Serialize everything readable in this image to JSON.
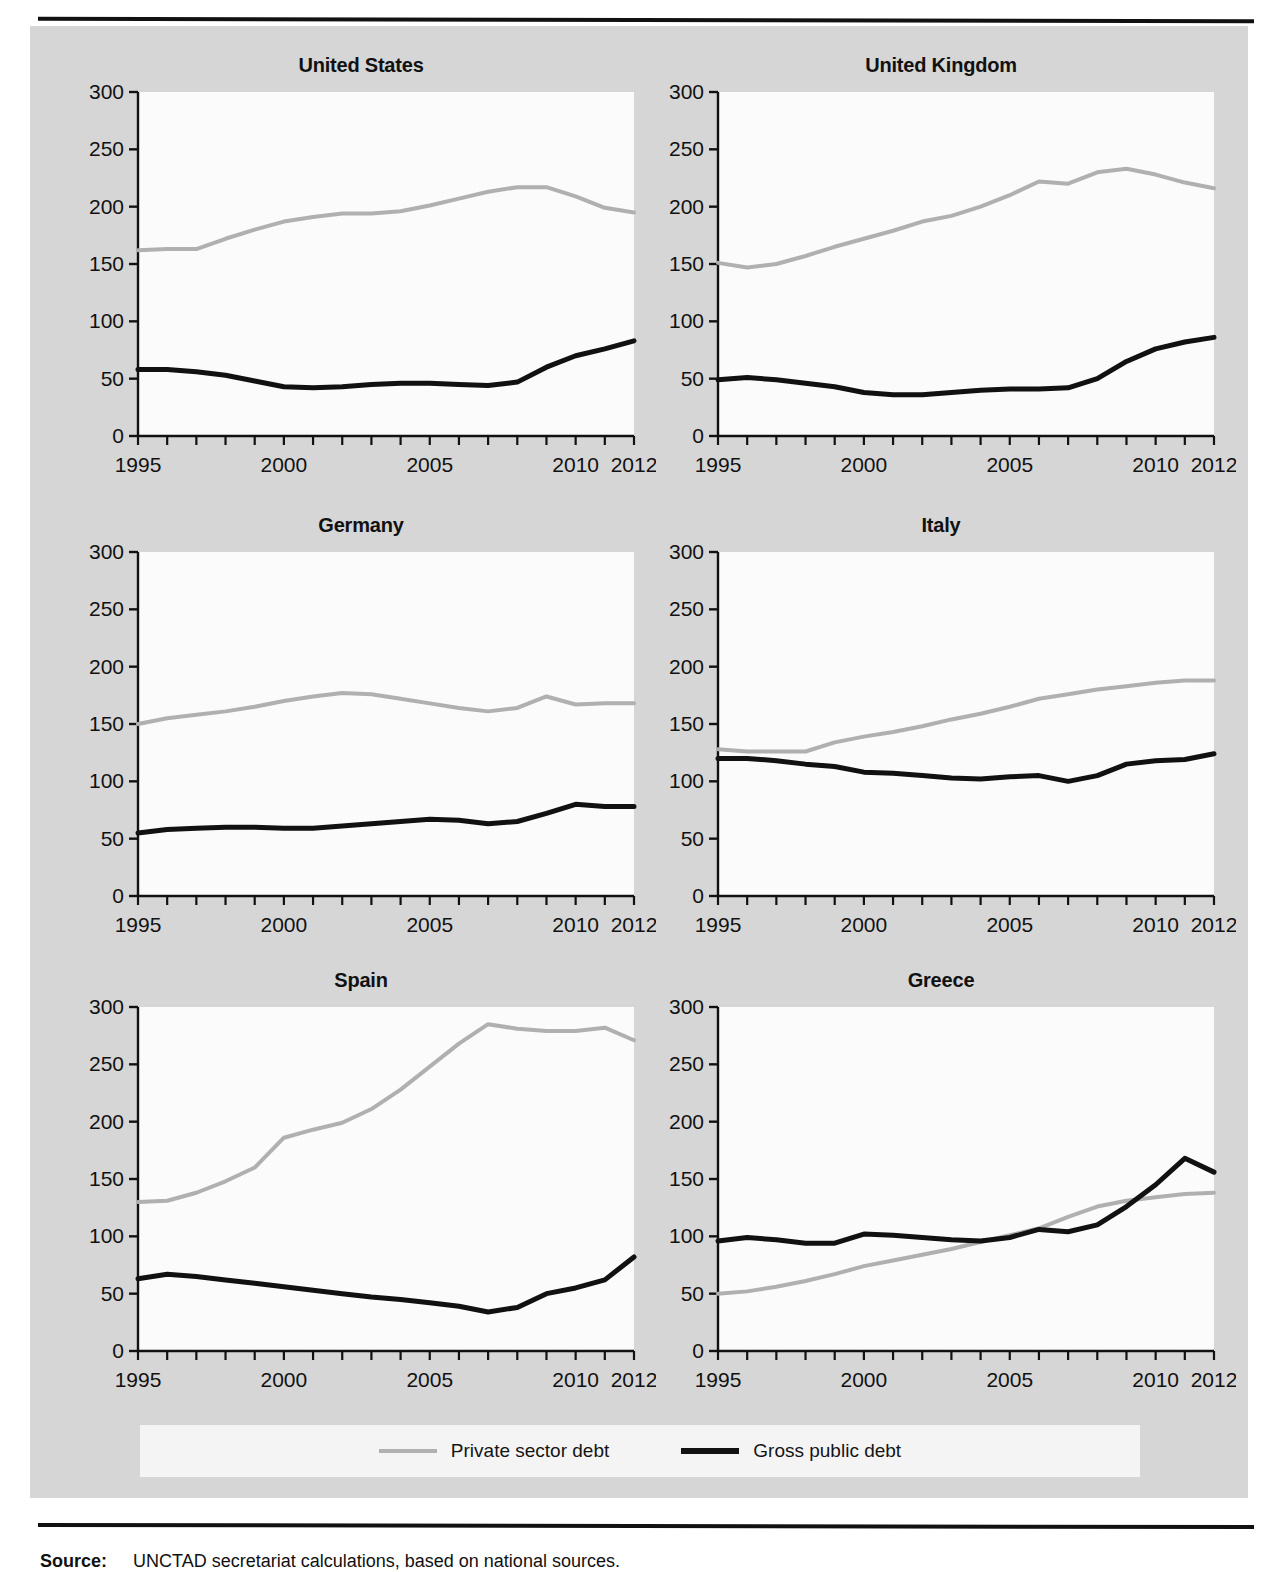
{
  "figure": {
    "source_label": "Source:",
    "source_text": "UNCTAD secretariat calculations, based on national sources."
  },
  "legend": {
    "items": [
      {
        "label": "Private sector debt",
        "color": "#b0b0b0",
        "swatch": "private"
      },
      {
        "label": "Gross public debt",
        "color": "#111111",
        "swatch": "public"
      }
    ]
  },
  "chart_data": [
    {
      "type": "line",
      "title": "United States",
      "xlabel": "",
      "ylabel": "",
      "xlim": [
        1995,
        2012
      ],
      "ylim": [
        0,
        300
      ],
      "yticks": [
        0,
        50,
        100,
        150,
        200,
        250,
        300
      ],
      "xticks": [
        1995,
        2000,
        2005,
        2010,
        2012
      ],
      "x": [
        1995,
        1996,
        1997,
        1998,
        1999,
        2000,
        2001,
        2002,
        2003,
        2004,
        2005,
        2006,
        2007,
        2008,
        2009,
        2010,
        2011,
        2012
      ],
      "grid": false,
      "legend_position": "bottom-shared",
      "series": [
        {
          "name": "Private sector debt",
          "color": "#b0b0b0",
          "values": [
            162,
            163,
            163,
            172,
            180,
            187,
            191,
            194,
            194,
            196,
            201,
            207,
            213,
            217,
            217,
            209,
            199,
            195
          ]
        },
        {
          "name": "Gross public debt",
          "color": "#111111",
          "values": [
            58,
            58,
            56,
            53,
            48,
            43,
            42,
            43,
            45,
            46,
            46,
            45,
            44,
            47,
            60,
            70,
            76,
            83
          ]
        }
      ]
    },
    {
      "type": "line",
      "title": "United Kingdom",
      "xlabel": "",
      "ylabel": "",
      "xlim": [
        1995,
        2012
      ],
      "ylim": [
        0,
        300
      ],
      "yticks": [
        0,
        50,
        100,
        150,
        200,
        250,
        300
      ],
      "xticks": [
        1995,
        2000,
        2005,
        2010,
        2012
      ],
      "x": [
        1995,
        1996,
        1997,
        1998,
        1999,
        2000,
        2001,
        2002,
        2003,
        2004,
        2005,
        2006,
        2007,
        2008,
        2009,
        2010,
        2011,
        2012
      ],
      "grid": false,
      "legend_position": "bottom-shared",
      "series": [
        {
          "name": "Private sector debt",
          "color": "#b0b0b0",
          "values": [
            151,
            147,
            150,
            157,
            165,
            172,
            179,
            187,
            192,
            200,
            210,
            222,
            220,
            230,
            233,
            228,
            221,
            216
          ]
        },
        {
          "name": "Gross public debt",
          "color": "#111111",
          "values": [
            49,
            51,
            49,
            46,
            43,
            38,
            36,
            36,
            38,
            40,
            41,
            41,
            42,
            50,
            65,
            76,
            82,
            86
          ]
        }
      ]
    },
    {
      "type": "line",
      "title": "Germany",
      "xlabel": "",
      "ylabel": "",
      "xlim": [
        1995,
        2012
      ],
      "ylim": [
        0,
        300
      ],
      "yticks": [
        0,
        50,
        100,
        150,
        200,
        250,
        300
      ],
      "xticks": [
        1995,
        2000,
        2005,
        2010,
        2012
      ],
      "x": [
        1995,
        1996,
        1997,
        1998,
        1999,
        2000,
        2001,
        2002,
        2003,
        2004,
        2005,
        2006,
        2007,
        2008,
        2009,
        2010,
        2011,
        2012
      ],
      "grid": false,
      "legend_position": "bottom-shared",
      "series": [
        {
          "name": "Private sector debt",
          "color": "#b0b0b0",
          "values": [
            150,
            155,
            158,
            161,
            165,
            170,
            174,
            177,
            176,
            172,
            168,
            164,
            161,
            164,
            174,
            167,
            168,
            168
          ]
        },
        {
          "name": "Gross public debt",
          "color": "#111111",
          "values": [
            55,
            58,
            59,
            60,
            60,
            59,
            59,
            61,
            63,
            65,
            67,
            66,
            63,
            65,
            72,
            80,
            78,
            78
          ]
        }
      ]
    },
    {
      "type": "line",
      "title": "Italy",
      "xlabel": "",
      "ylabel": "",
      "xlim": [
        1995,
        2012
      ],
      "ylim": [
        0,
        300
      ],
      "yticks": [
        0,
        50,
        100,
        150,
        200,
        250,
        300
      ],
      "xticks": [
        1995,
        2000,
        2005,
        2010,
        2012
      ],
      "x": [
        1995,
        1996,
        1997,
        1998,
        1999,
        2000,
        2001,
        2002,
        2003,
        2004,
        2005,
        2006,
        2007,
        2008,
        2009,
        2010,
        2011,
        2012
      ],
      "grid": false,
      "legend_position": "bottom-shared",
      "series": [
        {
          "name": "Private sector debt",
          "color": "#b0b0b0",
          "values": [
            128,
            126,
            126,
            126,
            134,
            139,
            143,
            148,
            154,
            159,
            165,
            172,
            176,
            180,
            183,
            186,
            188,
            188
          ]
        },
        {
          "name": "Gross public debt",
          "color": "#111111",
          "values": [
            120,
            120,
            118,
            115,
            113,
            108,
            107,
            105,
            103,
            102,
            104,
            105,
            100,
            105,
            115,
            118,
            119,
            124
          ]
        }
      ]
    },
    {
      "type": "line",
      "title": "Spain",
      "xlabel": "",
      "ylabel": "",
      "xlim": [
        1995,
        2012
      ],
      "ylim": [
        0,
        300
      ],
      "yticks": [
        0,
        50,
        100,
        150,
        200,
        250,
        300
      ],
      "xticks": [
        1995,
        2000,
        2005,
        2010,
        2012
      ],
      "x": [
        1995,
        1996,
        1997,
        1998,
        1999,
        2000,
        2001,
        2002,
        2003,
        2004,
        2005,
        2006,
        2007,
        2008,
        2009,
        2010,
        2011,
        2012
      ],
      "grid": false,
      "legend_position": "bottom-shared",
      "series": [
        {
          "name": "Private sector debt",
          "color": "#b0b0b0",
          "values": [
            130,
            131,
            138,
            148,
            160,
            186,
            193,
            199,
            211,
            228,
            248,
            268,
            285,
            281,
            279,
            279,
            282,
            271
          ]
        },
        {
          "name": "Gross public debt",
          "color": "#111111",
          "values": [
            63,
            67,
            65,
            62,
            59,
            56,
            53,
            50,
            47,
            45,
            42,
            39,
            34,
            38,
            50,
            55,
            62,
            82
          ]
        }
      ]
    },
    {
      "type": "line",
      "title": "Greece",
      "xlabel": "",
      "ylabel": "",
      "xlim": [
        1995,
        2012
      ],
      "ylim": [
        0,
        300
      ],
      "yticks": [
        0,
        50,
        100,
        150,
        200,
        250,
        300
      ],
      "xticks": [
        1995,
        2000,
        2005,
        2010,
        2012
      ],
      "x": [
        1995,
        1996,
        1997,
        1998,
        1999,
        2000,
        2001,
        2002,
        2003,
        2004,
        2005,
        2006,
        2007,
        2008,
        2009,
        2010,
        2011,
        2012
      ],
      "grid": false,
      "legend_position": "bottom-shared",
      "series": [
        {
          "name": "Private sector debt",
          "color": "#b0b0b0",
          "values": [
            50,
            52,
            56,
            61,
            67,
            74,
            79,
            84,
            89,
            95,
            101,
            107,
            117,
            126,
            131,
            134,
            137,
            138
          ]
        },
        {
          "name": "Gross public debt",
          "color": "#111111",
          "values": [
            96,
            99,
            97,
            94,
            94,
            102,
            101,
            99,
            97,
            96,
            99,
            106,
            104,
            110,
            126,
            145,
            168,
            156
          ]
        }
      ]
    }
  ]
}
